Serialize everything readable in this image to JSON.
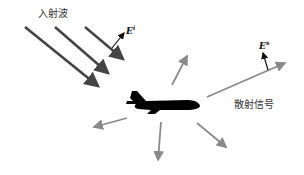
{
  "diagram": {
    "incident_label": "入射波",
    "scattered_label": "散射信号",
    "incident_field_label": "E",
    "incident_field_sup": "i",
    "scattered_field_label": "E",
    "scattered_field_sup": "s",
    "colors": {
      "incident_arrow": "#444444",
      "scattered_arrow": "#8a8a8a",
      "aircraft": "#000000",
      "field_vector": "#111111"
    },
    "incident_arrows": [
      {
        "x1": 25,
        "y1": 27,
        "x2": 100,
        "y2": 88
      },
      {
        "x1": 55,
        "y1": 27,
        "x2": 110,
        "y2": 75
      },
      {
        "x1": 85,
        "y1": 27,
        "x2": 125,
        "y2": 60
      }
    ],
    "scattered_arrows": [
      {
        "x1": 172,
        "y1": 85,
        "x2": 188,
        "y2": 54
      },
      {
        "x1": 207,
        "y1": 97,
        "x2": 287,
        "y2": 62
      },
      {
        "x1": 127,
        "y1": 118,
        "x2": 92,
        "y2": 128
      },
      {
        "x1": 160,
        "y1": 122,
        "x2": 157,
        "y2": 162
      },
      {
        "x1": 197,
        "y1": 123,
        "x2": 228,
        "y2": 148
      }
    ]
  }
}
